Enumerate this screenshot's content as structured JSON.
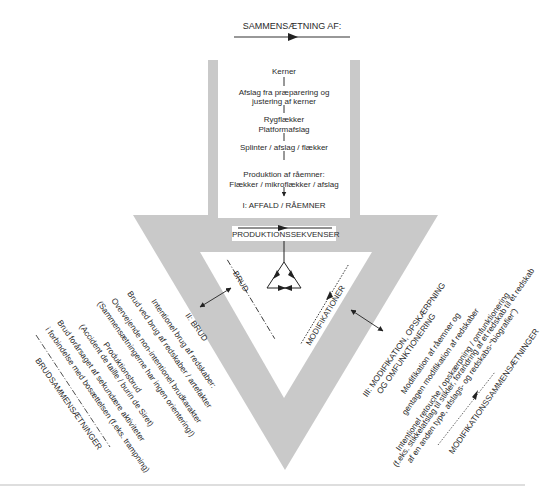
{
  "header": {
    "title": "SAMMENSÆTNING AF:"
  },
  "composition_box": {
    "items": [
      "Kerner",
      "Afslag fra præparering og",
      "justering af kerner",
      "Rygflækker",
      "Platformafslag",
      "Splinter / afslag / flækker",
      "Produktion af råemner:",
      "Flækker / mikroflækker / afslag",
      "I: AFFALD / RÅEMNER"
    ]
  },
  "production_label": "PRODUKTIONSSEKVENSER",
  "arms": {
    "left_label": "BRUD",
    "right_label": "MODIFIKATIONER"
  },
  "brud_section": {
    "title": "II: BRUD",
    "lines": [
      "Intentionel brug af redskaber:",
      "Brud ved brug af redskaber / artefakter",
      "Overvejende non-intentionel brudkarakter",
      "(Sammensætningerne har ingen orientering!)",
      "Produktionsbrud",
      "(Accident de taille / burin de Siret)",
      "Brud forårsaget af sekundære aktiviteter",
      "i forbindelse med bosættelsen (f.eks. trampning)"
    ],
    "footer": "BRUDSAMMENSÆTNINGER"
  },
  "modifikation_section": {
    "title_line1": "III: MODIFIKATION, OPSKÆRPNING",
    "title_line2": "OG OMFUNKTIONERING",
    "lines": [
      "Modifikation af råemner og",
      "gentagen modifikation af redskaber",
      "Intentionel retouche / opskærpning / omfunktionering",
      "(f.eks. stikkelafslag til stikler, forandring af et redskab til et redskab",
      "af en anden type, afslags- og redskabs-\"biografier\")"
    ],
    "footer": "MODIFIKATIONSSAMMENSÆTNINGER"
  },
  "colors": {
    "grey_shape": "#c9c9c9",
    "line": "#222222",
    "text": "#2a2a2a",
    "rule": "#bdbdbd"
  }
}
